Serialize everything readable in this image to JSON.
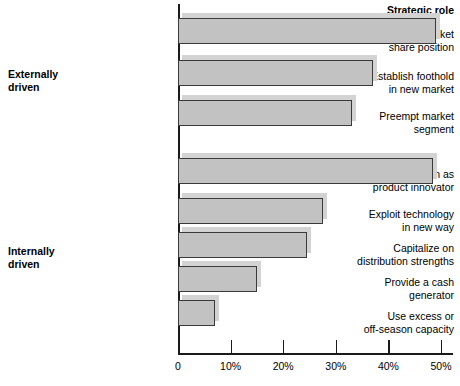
{
  "chart_data": {
    "type": "bar",
    "orientation": "horizontal",
    "title": "Strategic role",
    "xlabel": "",
    "ylabel": "",
    "xlim": [
      0,
      52
    ],
    "grid": false,
    "legend": null,
    "tick_labels": [
      "0",
      "10%",
      "20%",
      "30%",
      "40%",
      "50%"
    ],
    "tick_values": [
      0,
      10,
      20,
      30,
      40,
      50
    ],
    "groups": [
      {
        "name": "Externally driven",
        "label_line1": "Externally",
        "label_line2": "driven"
      },
      {
        "name": "Internally driven",
        "label_line1": "Internally",
        "label_line2": "driven"
      }
    ],
    "categories": [
      "Defend market share position",
      "Establish foothold in new market",
      "Preempt market segment",
      "Maintain position as product innovator",
      "Exploit technology in new way",
      "Capitalize on distribution strengths",
      "Provide a cash generator",
      "Use excess or off-season capacity"
    ],
    "values": [
      49,
      37,
      33,
      48.5,
      27.5,
      24.5,
      15,
      7
    ],
    "bars": [
      {
        "label_line1": "Defend market",
        "label_line2": "share position",
        "value": 49,
        "group": "Externally driven"
      },
      {
        "label_line1": "Establish foothold",
        "label_line2": "in new market",
        "value": 37,
        "group": "Externally driven"
      },
      {
        "label_line1": "Preempt market",
        "label_line2": "segment",
        "value": 33,
        "group": "Externally driven"
      },
      {
        "label_line1": "Maintain position as",
        "label_line2": "product innovator",
        "value": 48.5,
        "group": "Internally driven"
      },
      {
        "label_line1": "Exploit technology",
        "label_line2": "in new way",
        "value": 27.5,
        "group": "Internally driven"
      },
      {
        "label_line1": "Capitalize on",
        "label_line2": "distribution strengths",
        "value": 24.5,
        "group": "Internally driven"
      },
      {
        "label_line1": "Provide a cash",
        "label_line2": "generator",
        "value": 15,
        "group": "Internally driven"
      },
      {
        "label_line1": "Use excess or",
        "label_line2": "off-season capacity",
        "value": 7,
        "group": "Internally driven"
      }
    ],
    "colors": {
      "bar_fill": "#c2c2c2",
      "bar_border": "#3a3a3a",
      "bar_shadow": "#d3d3d3",
      "axis": "#1a1a1a",
      "text": "#000000",
      "background": "#ffffff"
    }
  }
}
